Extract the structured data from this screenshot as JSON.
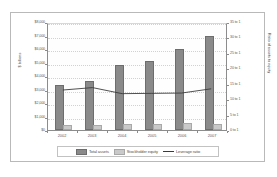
{
  "chart_data": {
    "type": "bar",
    "title": "",
    "subtitle": "",
    "xlabel": "",
    "ylabel": "$ billions",
    "y2label": "Ratio of assets to equity",
    "categories": [
      "2002",
      "2003",
      "2004",
      "2005",
      "2006",
      "2007"
    ],
    "ylim": [
      0,
      8000
    ],
    "y2lim": [
      0,
      35
    ],
    "grid": true,
    "legend_position": "bottom",
    "y_ticks": [
      "$0",
      "$1,000",
      "$2,000",
      "$3,000",
      "$4,000",
      "$5,000",
      "$6,000",
      "$7,000",
      "$8,000"
    ],
    "y_tick_values": [
      0,
      1000,
      2000,
      3000,
      4000,
      5000,
      6000,
      7000,
      8000
    ],
    "y2_ticks": [
      "0 to 1",
      "5 to 1",
      "10 to 1",
      "15 to 1",
      "20 to 1",
      "25 to 1",
      "30 to 1",
      "35 to 1"
    ],
    "y2_tick_values": [
      0,
      5,
      10,
      15,
      20,
      25,
      30,
      35
    ],
    "series": [
      {
        "name": "Total assets",
        "type": "bar",
        "axis": "left",
        "color": "#8a8a8a",
        "values": [
          3150,
          3500,
          4650,
          4980,
          5860,
          6800
        ]
      },
      {
        "name": "Stockholder equity",
        "type": "bar",
        "axis": "left",
        "color": "#c9c9c9",
        "values": [
          230,
          260,
          300,
          300,
          340,
          330
        ]
      },
      {
        "name": "Leverage ratio",
        "type": "line",
        "axis": "right",
        "color": "#3a3a3a",
        "values": [
          13.2,
          14.0,
          12.0,
          12.1,
          12.2,
          13.6
        ]
      }
    ]
  },
  "legend": {
    "items": [
      {
        "label": "Total assets",
        "marker": "swatch-dark"
      },
      {
        "label": "Stockholder equity",
        "marker": "swatch-light"
      },
      {
        "label": "Leverage ratio",
        "marker": "line"
      }
    ]
  }
}
